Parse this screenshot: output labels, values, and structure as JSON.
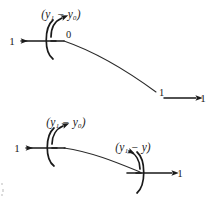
{
  "figure": {
    "width": 212,
    "height": 202,
    "background": "#ffffff",
    "ink_color": "#1a1a1a",
    "type": "mathematical-flow-diagram"
  },
  "diagrams": [
    {
      "id": "upper",
      "nodes": [
        {
          "id": "upper-source",
          "state_label": "0",
          "arc_label": "(y₁ − y₀)",
          "out_label": "1",
          "out_direction": "left"
        },
        {
          "id": "upper-target",
          "state_label": "1",
          "out_label": "1",
          "out_direction": "right"
        }
      ]
    },
    {
      "id": "lower",
      "nodes": [
        {
          "id": "lower-left",
          "arc_label": "(y₁ − y₀)",
          "out_label": "1",
          "out_direction": "left"
        },
        {
          "id": "lower-right",
          "arc_label": "(y₁ − y)",
          "out_label": "1",
          "out_direction": "right"
        }
      ]
    }
  ],
  "labels": {
    "upper_arc_expression": "(y₁ − y₀)",
    "upper_state_zero": "0",
    "upper_out_one": "1",
    "upper_target_state_one": "1",
    "upper_target_out_one": "1",
    "lower_left_arc_expression": "(y₁ − y₀)",
    "lower_left_out_one": "1",
    "lower_right_arc_expression": "(y₁ − y)",
    "lower_right_out_one": "1"
  }
}
